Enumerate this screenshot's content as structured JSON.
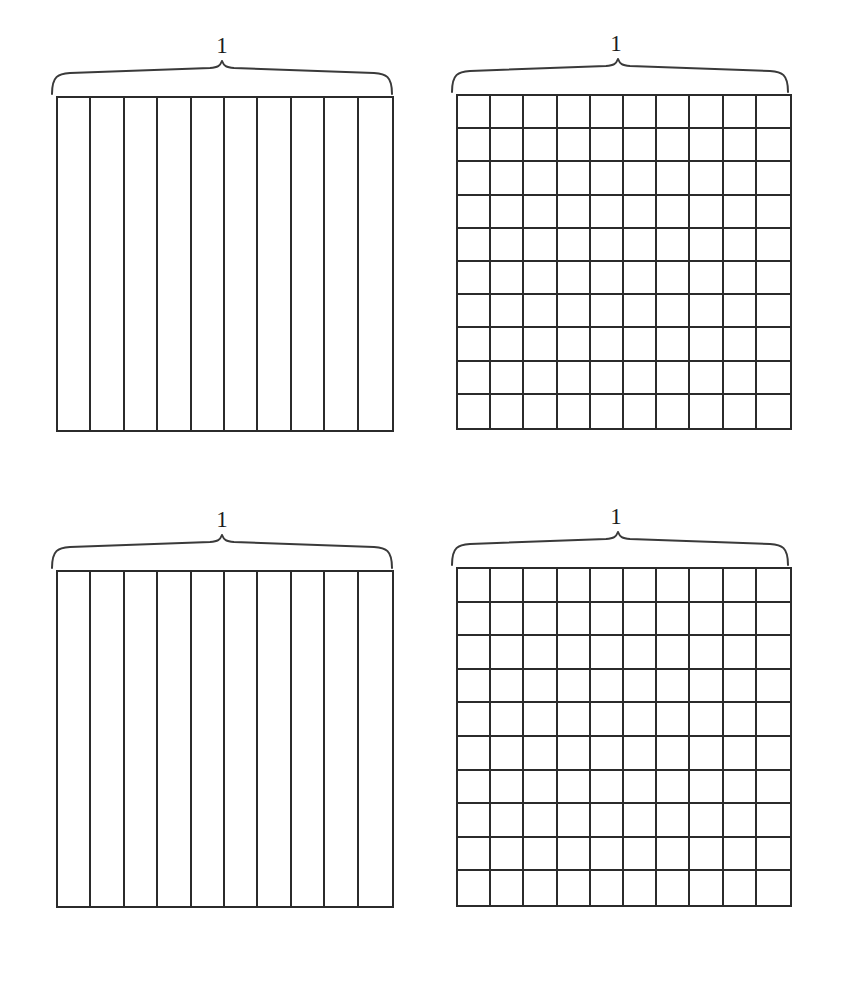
{
  "page": {
    "background_color": "#ffffff",
    "line_color": "#2b2b2b",
    "brace_color": "#3a3a3a",
    "text_color": "#1c1c1c",
    "width": 842,
    "height": 990
  },
  "figures": [
    {
      "id": "top-left",
      "position": "top-left",
      "label": "1",
      "model": "tenths",
      "columns": 10,
      "rows": 1,
      "total_parts": 10,
      "shaded_parts": 0,
      "brace_label": "1"
    },
    {
      "id": "top-right",
      "position": "top-right",
      "label": "1",
      "model": "hundredths",
      "columns": 10,
      "rows": 10,
      "total_parts": 100,
      "shaded_parts": 0,
      "brace_label": "1"
    },
    {
      "id": "bottom-left",
      "position": "bottom-left",
      "label": "1",
      "model": "tenths",
      "columns": 10,
      "rows": 1,
      "total_parts": 10,
      "shaded_parts": 0,
      "brace_label": "1"
    },
    {
      "id": "bottom-right",
      "position": "bottom-right",
      "label": "1",
      "model": "hundredths",
      "columns": 10,
      "rows": 10,
      "total_parts": 100,
      "shaded_parts": 0,
      "brace_label": "1"
    }
  ],
  "chart_data": {
    "type": "table",
    "title": "",
    "xlabel": "",
    "ylabel": "",
    "categories": [
      "top-left",
      "top-right",
      "bottom-left",
      "bottom-right"
    ],
    "series": [
      {
        "name": "columns",
        "values": [
          10,
          10,
          10,
          10
        ]
      },
      {
        "name": "rows",
        "values": [
          1,
          10,
          1,
          10
        ]
      },
      {
        "name": "total_parts",
        "values": [
          10,
          100,
          10,
          100
        ]
      },
      {
        "name": "shaded_parts",
        "values": [
          0,
          0,
          0,
          0
        ]
      }
    ],
    "annotations": [
      "1",
      "1",
      "1",
      "1"
    ],
    "grid": true,
    "legend": "none"
  }
}
